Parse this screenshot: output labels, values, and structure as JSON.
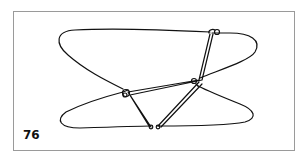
{
  "figure": {
    "number": "76"
  },
  "colors": {
    "stroke": "#111111",
    "frame": "#9a9a9a",
    "background": "#ffffff"
  }
}
